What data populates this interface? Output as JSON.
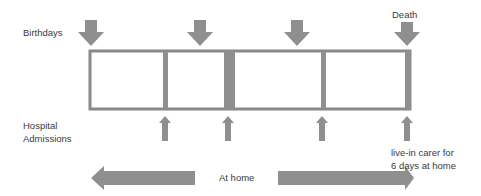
{
  "labels": {
    "birthdays": "Birthdays",
    "death": "Death",
    "hospital_line1": "Hospital",
    "hospital_line2": "Admissions",
    "carer_line1": "live-in carer for",
    "carer_line2": "6 days at home",
    "at_home": "At home"
  },
  "colors": {
    "arrow": "#8f8f8f",
    "box_border": "#8a8a8a",
    "separator": "#8f8f8f",
    "text": "#3a3a3a"
  },
  "timeline": {
    "box": {
      "x": 90,
      "y": 51,
      "width": 320,
      "height": 58
    },
    "separators": [
      {
        "x": 163,
        "width": 5
      },
      {
        "x": 224,
        "width": 11
      },
      {
        "x": 321,
        "width": 5
      },
      {
        "x": 405,
        "width": 6
      }
    ]
  },
  "birthday_arrows_x": [
    91,
    200,
    297
  ],
  "death_arrow_x": 407,
  "admission_arrows_x": [
    165,
    228,
    322,
    407
  ]
}
